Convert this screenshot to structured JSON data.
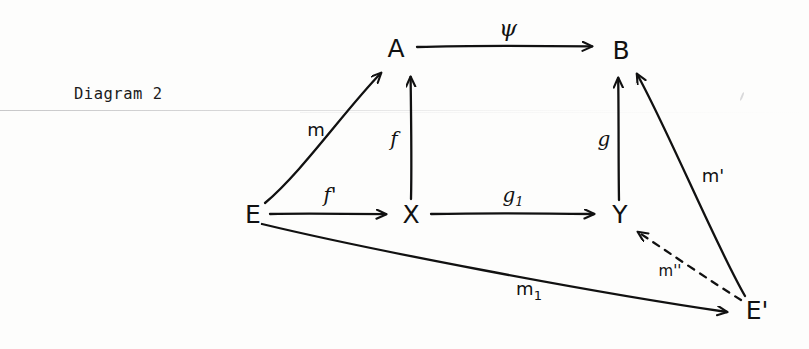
{
  "caption": "Diagram 2",
  "diagram": {
    "title": "Diagram 2",
    "ink_color": "#111111",
    "background_color": "#fdfdfc",
    "nodes": [
      {
        "id": "A",
        "label": "A",
        "x": 396,
        "y": 50
      },
      {
        "id": "B",
        "label": "B",
        "x": 621,
        "y": 52
      },
      {
        "id": "E",
        "label": "E",
        "x": 253,
        "y": 216
      },
      {
        "id": "X",
        "label": "X",
        "x": 411,
        "y": 216
      },
      {
        "id": "Y",
        "label": "Y",
        "x": 620,
        "y": 216
      },
      {
        "id": "Ep",
        "label": "E'",
        "x": 757,
        "y": 312
      }
    ],
    "edges": [
      {
        "id": "psi",
        "from": "A",
        "to": "B",
        "label": "ψ",
        "style": "solid",
        "label_x": 508,
        "label_y": 30
      },
      {
        "id": "f",
        "from": "X",
        "to": "A",
        "label": "f",
        "style": "solid",
        "label_x": 394,
        "label_y": 140
      },
      {
        "id": "m",
        "from": "E",
        "to": "A",
        "label": "m",
        "style": "solid",
        "label_x": 316,
        "label_y": 131
      },
      {
        "id": "fp",
        "from": "E",
        "to": "X",
        "label": "f'",
        "style": "solid",
        "label_x": 330,
        "label_y": 196
      },
      {
        "id": "g1",
        "from": "X",
        "to": "Y",
        "label": "g",
        "sublabel": "1",
        "style": "solid",
        "label_x": 513,
        "label_y": 196
      },
      {
        "id": "g",
        "from": "Y",
        "to": "B",
        "label": "g",
        "style": "solid",
        "label_x": 604,
        "label_y": 140
      },
      {
        "id": "mp",
        "from": "Ep",
        "to": "B",
        "label": "m'",
        "style": "solid",
        "label_x": 713,
        "label_y": 177
      },
      {
        "id": "m1",
        "from": "E",
        "to": "Ep",
        "label": "m",
        "sublabel": "1",
        "style": "solid",
        "label_x": 529,
        "label_y": 290
      },
      {
        "id": "mpp",
        "from": "Ep",
        "to": "Y",
        "label": "m''",
        "style": "dashed",
        "label_x": 670,
        "label_y": 271
      }
    ]
  }
}
